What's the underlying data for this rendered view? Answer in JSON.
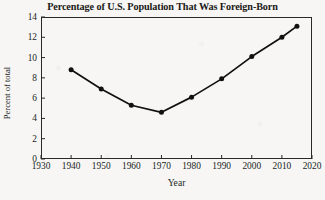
{
  "chart_data": {
    "type": "line",
    "title": "Percentage of U.S. Population That Was Foreign-Born",
    "xlabel": "Year",
    "ylabel": "Percent of total",
    "x": [
      1940,
      1950,
      1960,
      1970,
      1980,
      1990,
      2000,
      2010,
      2015
    ],
    "values": [
      8.8,
      6.9,
      5.3,
      4.6,
      6.1,
      7.9,
      10.1,
      12.0,
      13.1
    ],
    "xlim": [
      1930,
      2020
    ],
    "ylim": [
      0,
      14
    ],
    "xticks": [
      1930,
      1940,
      1950,
      1960,
      1970,
      1980,
      1990,
      2000,
      2010,
      2020
    ],
    "yticks": [
      0,
      2,
      4,
      6,
      8,
      10,
      12,
      14
    ],
    "xtick_labels": [
      "1930",
      "1940",
      "1950",
      "1960",
      "1970",
      "1980",
      "1990",
      "2000",
      "2010",
      "2020"
    ],
    "ytick_labels": [
      "0",
      "2",
      "4",
      "6",
      "8",
      "10",
      "12",
      "14"
    ],
    "grid": false,
    "legend": null,
    "series": [
      {
        "name": "Percent foreign-born",
        "marker": "filled-circle",
        "line_color": "#121110",
        "marker_color": "#121110",
        "points": [
          {
            "x": 1940,
            "y": 8.8
          },
          {
            "x": 1950,
            "y": 6.9
          },
          {
            "x": 1960,
            "y": 5.3
          },
          {
            "x": 1970,
            "y": 4.6
          },
          {
            "x": 1980,
            "y": 6.1
          },
          {
            "x": 1990,
            "y": 7.9
          },
          {
            "x": 2000,
            "y": 10.1
          },
          {
            "x": 2010,
            "y": 12.0
          },
          {
            "x": 2015,
            "y": 13.1
          }
        ]
      }
    ]
  },
  "colors": {
    "page_background": "#f7f6f4",
    "axis": "#2a2926",
    "text": "#201f1d",
    "data": "#121110"
  }
}
